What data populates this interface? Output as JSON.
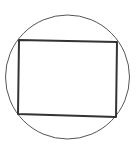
{
  "diagram": {
    "background": "#ffffff",
    "circle": {
      "cx": 67.5,
      "cy": 77,
      "r": 62,
      "stroke": "#555555",
      "stroke_width": 1
    },
    "rectangle": {
      "points": "19,40 117,42 116,117 18,114",
      "stroke": "#333333",
      "stroke_width": 2
    }
  }
}
